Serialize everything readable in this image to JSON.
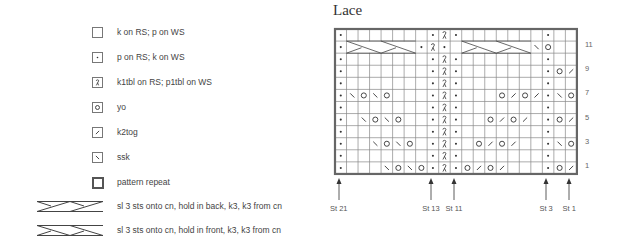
{
  "title": "Lace",
  "legend": [
    {
      "symbol": "knit",
      "label": "k on RS; p on WS"
    },
    {
      "symbol": "purl",
      "label": "p on RS; k on WS"
    },
    {
      "symbol": "k1tbl",
      "label": "k1tbl on RS; p1tbl on WS"
    },
    {
      "symbol": "yo",
      "label": "yo"
    },
    {
      "symbol": "k2tog",
      "label": "k2tog"
    },
    {
      "symbol": "ssk",
      "label": "ssk"
    },
    {
      "symbol": "repeat",
      "label": "pattern repeat"
    },
    {
      "symbol": "cable-back",
      "label": "sl 3 sts onto cn, hold in back, k3, k3 from cn"
    },
    {
      "symbol": "cable-front",
      "label": "sl 3 sts onto cn, hold in front, k3, k3 from cn"
    }
  ],
  "chart": {
    "columns": 21,
    "rows": 12,
    "row_numbers": [
      "11",
      "9",
      "7",
      "5",
      "3",
      "1"
    ],
    "arrows": [
      {
        "label": "St 21",
        "col": 0
      },
      {
        "label": "St 13",
        "col": 8
      },
      {
        "label": "St 11",
        "col": 10
      },
      {
        "label": "St 3",
        "col": 18
      },
      {
        "label": "St 1",
        "col": 20
      }
    ],
    "repeat_cols": [
      0,
      17
    ],
    "grid_rows_top_to_bottom": [
      "P.......PTP.......P..",
      "P......PTP......P\\O",
      "P.......PTP.......P..",
      "P.......PTP.......PO/",
      "P.......PTP.......P..",
      "P\\O\\O...PTP...O/O/P\\O",
      "P.......PTP.......P..",
      "P.\\O\\O..PTP..O/O/.PO/",
      "P.......PTP.......P..",
      "P..\\O\\O.PTP.O/O/..P\\O",
      "P.......PTP.......P..",
      "P...\\O\\OPTPO/O/...PO/"
    ],
    "cables": [
      {
        "row": 11,
        "start_col": 1,
        "span": 6,
        "type": "right"
      },
      {
        "row": 11,
        "start_col": 11,
        "span": 6,
        "type": "right"
      }
    ]
  }
}
